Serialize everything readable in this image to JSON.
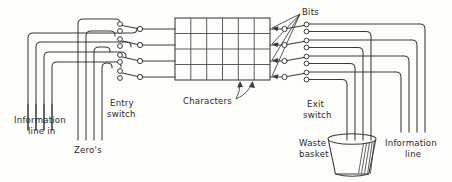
{
  "figure": {
    "kind": "hand-drawn engineering schematic",
    "background_color": "#fdfdfb",
    "ink_color": "#3a3a3a"
  },
  "labels": {
    "information_line_in": "Information\nline in",
    "information_line_in_l1": "Information",
    "information_line_in_l2": "line in",
    "zeros": "Zero's",
    "entry_switch_l1": "Entry",
    "entry_switch_l2": "switch",
    "characters": "Characters",
    "bits": "Bits",
    "exit_switch_l1": "Exit",
    "exit_switch_l2": "switch",
    "waste_basket_l1": "Waste",
    "waste_basket_l2": "basket",
    "information_line_out_l1": "Information",
    "information_line_out_l2": "line"
  },
  "matrix": {
    "name": "character-bit-matrix",
    "columns": 6,
    "rows": 4,
    "column_meaning": "Characters",
    "row_meaning": "Bits",
    "x": 175,
    "y": 18,
    "width": 95,
    "height": 62
  },
  "entry_switch": {
    "name": "entry-switch",
    "pole_count": 4,
    "contacts_per_pole": 2,
    "pivot_x": 140,
    "terminal_x": 120,
    "pole_y": [
      27,
      44,
      60,
      76
    ]
  },
  "exit_switch": {
    "name": "exit-switch",
    "pole_count": 4,
    "contacts_per_pole": 2,
    "pivot_x": 305,
    "terminal_x": 327,
    "pole_y": [
      27,
      44,
      60,
      76
    ]
  },
  "bus": {
    "information_in_count": 4,
    "zeros_count": 4,
    "information_out_count": 4,
    "waste_lines_count": 4
  },
  "waste_basket": {
    "name": "waste-basket",
    "top_cx": 352,
    "top_cy": 139,
    "top_rx": 24,
    "top_ry": 5,
    "bottom_cx": 352,
    "bottom_cy": 172,
    "bottom_rx": 17
  }
}
